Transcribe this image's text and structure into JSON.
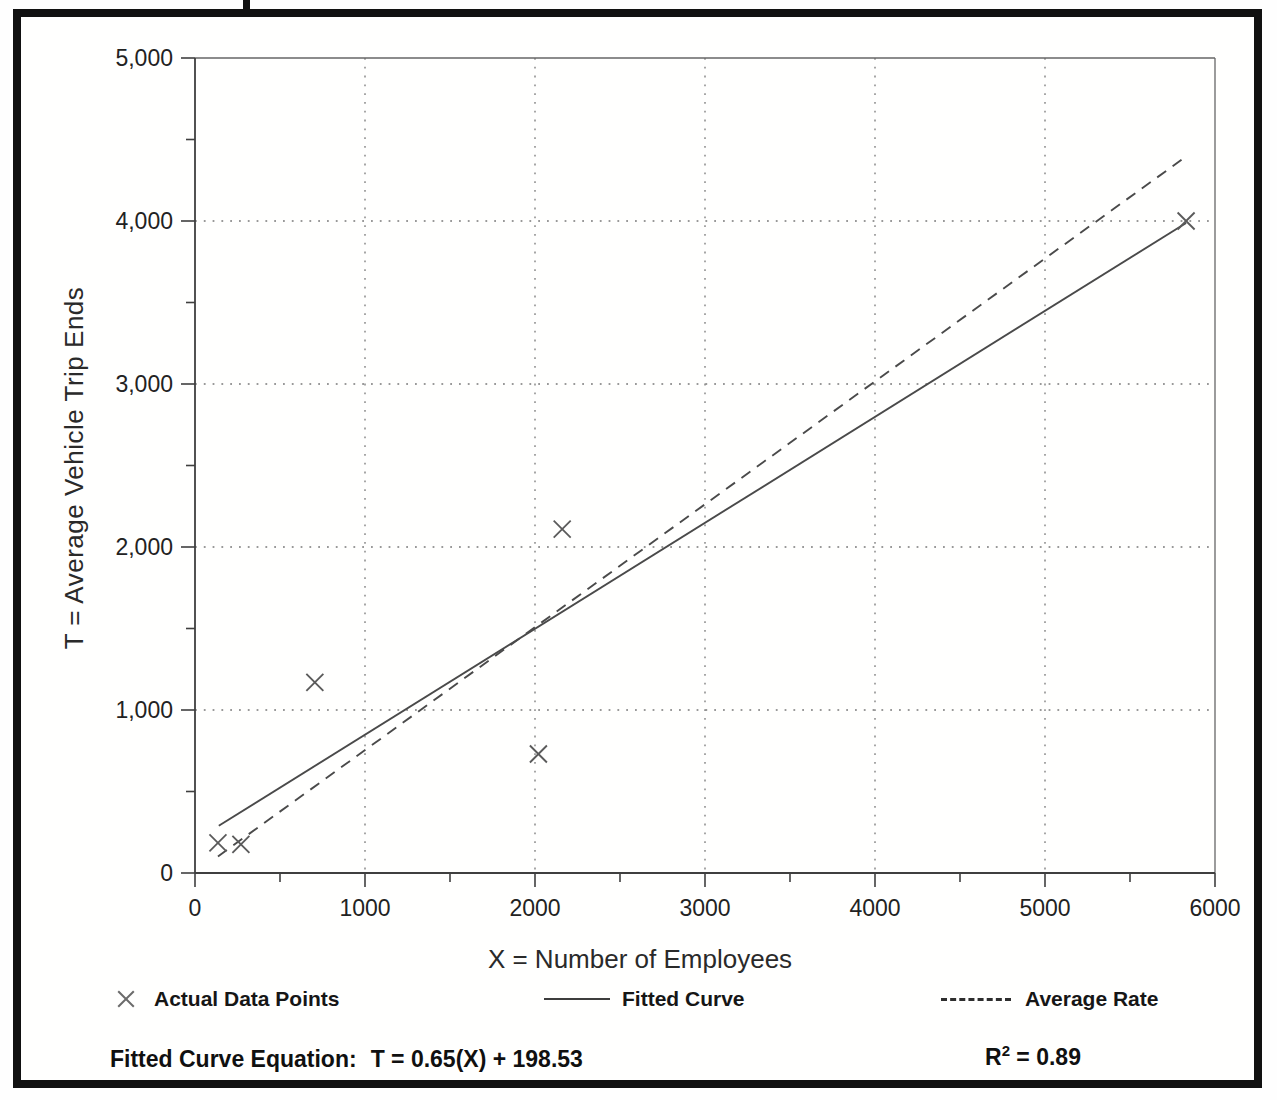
{
  "colors": {
    "ink": "#222222",
    "axis": "#3f3f3f",
    "plot_line": "#4a4a4a",
    "marker": "#5a5a5a",
    "grid": "#787878",
    "border_thin": "#666666",
    "frame": "#111111",
    "paper": "#fffffe"
  },
  "chart_data": {
    "type": "scatter",
    "title": "",
    "xlabel": "X = Number of Employees",
    "ylabel": "T = Average Vehicle Trip Ends",
    "xlim": [
      0,
      6000
    ],
    "ylim": [
      0,
      5000
    ],
    "x_major_ticks": [
      0,
      1000,
      2000,
      3000,
      4000,
      5000,
      6000
    ],
    "x_tick_labels": [
      "0",
      "1000",
      "2000",
      "3000",
      "4000",
      "5000",
      "6000"
    ],
    "y_major_ticks": [
      0,
      1000,
      2000,
      3000,
      4000,
      5000
    ],
    "y_tick_labels": [
      "0",
      "1,000",
      "2,000",
      "3,000",
      "4,000",
      "5,000"
    ],
    "minor_tick_step": 500,
    "grid": {
      "style": "dotted",
      "vertical_at_x": [
        1000,
        2000,
        3000,
        4000,
        5000
      ],
      "horizontal_at_y": [
        1000,
        2000,
        3000,
        4000
      ]
    },
    "plot_border": {
      "top_at_y": 5000,
      "right_at_x": 6000
    },
    "points": [
      [
        135,
        185
      ],
      [
        270,
        175
      ],
      [
        705,
        1170
      ],
      [
        2020,
        730
      ],
      [
        2160,
        2110
      ],
      [
        5830,
        4000
      ]
    ],
    "series": [
      {
        "name": "Actual Data Points",
        "kind": "scatter",
        "marker": "x"
      },
      {
        "name": "Fitted Curve",
        "kind": "line",
        "style": "solid",
        "slope": 0.65,
        "intercept": 198.53,
        "x_range": [
          140,
          5830
        ]
      },
      {
        "name": "Average Rate",
        "kind": "line",
        "style": "dashed",
        "slope": 0.754,
        "intercept": 0,
        "x_range": [
          135,
          5835
        ]
      }
    ],
    "legend": {
      "position": "bottom",
      "items": [
        {
          "swatch": "x-marker",
          "label": "Actual Data Points"
        },
        {
          "swatch": "solid-line",
          "label": "Fitted Curve"
        },
        {
          "swatch": "dashed-line",
          "label": "Average Rate"
        }
      ]
    },
    "footer": {
      "equation_label": "Fitted Curve Equation:",
      "equation_value": "T = 0.65(X) + 198.53",
      "r2_base": "R",
      "r2_exponent": "2",
      "r2_value": " = 0.89"
    }
  }
}
